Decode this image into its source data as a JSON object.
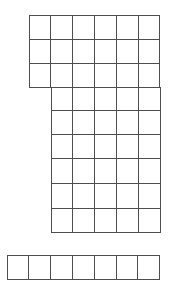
{
  "figure": {
    "canvas": {
      "width": 182,
      "height": 298,
      "background_color": "#ffffff"
    },
    "line_color": "#4d4d52",
    "line_width": 1,
    "cell_fill": "#ffffff",
    "cell_width": 21.8,
    "cell_height": 24.2,
    "origin_x": 29,
    "origin_y": 15,
    "column_x": [
      7,
      29,
      51,
      73,
      94,
      116,
      138,
      160
    ],
    "row_y": [
      15,
      39,
      63,
      87,
      110,
      134,
      158,
      183,
      208,
      232,
      255,
      279
    ],
    "total_cells": 49,
    "blocks": [
      {
        "name": "top-block",
        "columns": 6,
        "rows": 3,
        "col_start": 1,
        "row_start": 0,
        "cells": 18
      },
      {
        "name": "middle-block",
        "columns": 5,
        "rows": 6,
        "col_start": 2,
        "row_start": 3,
        "cells": 30
      },
      {
        "name": "bottom-bar",
        "columns": 7,
        "rows": 1,
        "col_start": 0,
        "row_start": 10,
        "cells": 7
      }
    ],
    "rows_layout": [
      {
        "row": 0,
        "y_top": 15,
        "y_bottom": 39,
        "x_start": 29,
        "cells": 6
      },
      {
        "row": 1,
        "y_top": 39,
        "y_bottom": 63,
        "x_start": 29,
        "cells": 6
      },
      {
        "row": 2,
        "y_top": 63,
        "y_bottom": 87,
        "x_start": 29,
        "cells": 6
      },
      {
        "row": 3,
        "y_top": 87,
        "y_bottom": 110,
        "x_start": 51,
        "cells": 5
      },
      {
        "row": 4,
        "y_top": 110,
        "y_bottom": 134,
        "x_start": 51,
        "cells": 5
      },
      {
        "row": 5,
        "y_top": 134,
        "y_bottom": 158,
        "x_start": 51,
        "cells": 5
      },
      {
        "row": 6,
        "y_top": 158,
        "y_bottom": 183,
        "x_start": 51,
        "cells": 5
      },
      {
        "row": 7,
        "y_top": 183,
        "y_bottom": 208,
        "x_start": 51,
        "cells": 5
      },
      {
        "row": 8,
        "y_top": 208,
        "y_bottom": 232,
        "x_start": 51,
        "cells": 5
      },
      {
        "row": 9,
        "y_top": 255,
        "y_bottom": 279,
        "x_start": 7,
        "cells": 7
      }
    ]
  }
}
